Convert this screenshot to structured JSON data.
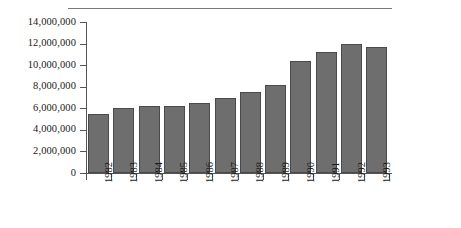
{
  "chart_data": {
    "type": "bar",
    "title": "",
    "subtitle": "",
    "xlabel": "",
    "ylabel": "",
    "categories": [
      "1982",
      "1983",
      "1984",
      "1985",
      "1986",
      "1987",
      "1988",
      "1989",
      "1990",
      "1991",
      "1992",
      "1993"
    ],
    "values": [
      5500000,
      6000000,
      6200000,
      6200000,
      6500000,
      7000000,
      7500000,
      8200000,
      10400000,
      11200000,
      12000000,
      11700000
    ],
    "ylim": [
      0,
      14000000
    ],
    "ytick_values": [
      0,
      2000000,
      4000000,
      6000000,
      8000000,
      10000000,
      12000000,
      14000000
    ],
    "ytick_labels": [
      "0",
      "2,000,000",
      "4,000,000",
      "6,000,000",
      "8,000,000",
      "10,000,000",
      "12,000,000",
      "14,000,000"
    ],
    "grid": false,
    "legend": null,
    "legend_position": "none",
    "annotations": [],
    "bar_color": "#6e6e6e",
    "bar_edge_color": "#4a4a4a",
    "axis_color": "#555555",
    "rule_color": "#7a7a7a",
    "background_color": "#ffffff",
    "xtick_label_rotation": 90
  }
}
